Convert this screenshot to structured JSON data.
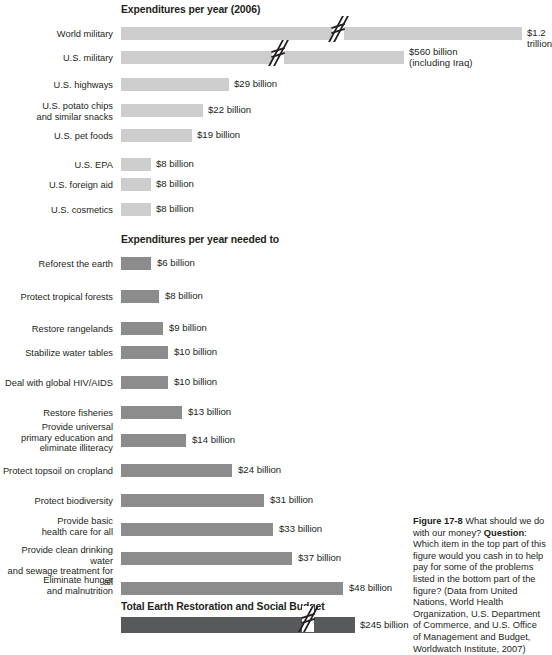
{
  "figure": {
    "number": "Figure 17-8",
    "caption_lead": "Figure 17-8",
    "caption_body": " What should we do with our money? ",
    "question_label": "Question",
    "caption_rest": ": Which item in the top part of this figure would you cash in to help pay for some of the problems listed in the bottom part of the figure? (Data from United Nations, World Health Organization, U.S. Department of Commerce, and U.S. Office of Management and Budget, Worldwatch Institute, 2007)"
  },
  "sections": {
    "top": {
      "title": "Expenditures per year (2006)"
    },
    "middle": {
      "title": "Expenditures per year needed to"
    },
    "total": {
      "title": "Total Earth Restoration and Social Budget"
    }
  },
  "chart_data": {
    "type": "bar",
    "title": "What should we do with our money?",
    "orientation": "horizontal",
    "xlabel": "",
    "ylabel": "",
    "note": "Horizontal bar chart, values in U.S. dollars per year. Top group bars are drawn to a broken (truncated) axis.",
    "groups": [
      {
        "name": "Expenditures per year (2006)",
        "bar_color": "#cdcdcd",
        "categories": [
          "World military",
          "U.S. military",
          "U.S. highways",
          "U.S. potato chips\nand similar snacks",
          "U.S. pet foods",
          "U.S. EPA",
          "U.S. foreign aid",
          "U.S. cosmetics"
        ],
        "values": [
          1200,
          560,
          29,
          22,
          19,
          8,
          8,
          8
        ],
        "value_labels": [
          "$1.2 trillion",
          "$560 billion\n(including Iraq)",
          "$29 billion",
          "$22 billion",
          "$19 billion",
          "$8 billion",
          "$8 billion",
          "$8 billion"
        ],
        "axis_break": [
          true,
          true,
          false,
          false,
          false,
          false,
          false,
          false
        ]
      },
      {
        "name": "Expenditures per year needed to",
        "bar_color": "#8c8c8c",
        "categories": [
          "Reforest the earth",
          "Protect tropical forests",
          "Restore rangelands",
          "Stabilize water tables",
          "Deal with global HIV/AIDS",
          "Restore fisheries",
          "Provide universal\nprimary education and\neliminate illiteracy",
          "Protect topsoil on cropland",
          "Protect biodiversity",
          "Provide basic\nhealth care for all",
          "Provide clean drinking water\nand sewage treatment for all",
          "Eliminate hunger\nand malnutrition"
        ],
        "values": [
          6,
          8,
          9,
          10,
          10,
          13,
          14,
          24,
          31,
          33,
          37,
          48
        ],
        "value_labels": [
          "$6 billion",
          "$8 billion",
          "$9 billion",
          "$10 billion",
          "$10 billion",
          "$13 billion",
          "$14 billion",
          "$24 billion",
          "$31 billion",
          "$33 billion",
          "$37 billion",
          "$48 billion"
        ],
        "axis_break": [
          false,
          false,
          false,
          false,
          false,
          false,
          false,
          false,
          false,
          false,
          false,
          false
        ]
      },
      {
        "name": "Total Earth Restoration and Social Budget",
        "bar_color": "#58595b",
        "categories": [
          ""
        ],
        "values": [
          245
        ],
        "value_labels": [
          "$245 billion"
        ],
        "axis_break": [
          true
        ]
      }
    ],
    "colors": {
      "expenditures_bar": "#cdcdcd",
      "needed_bar": "#8c8c8c",
      "total_bar": "#58595b",
      "text": "#231f20",
      "background": "#ffffff"
    }
  },
  "rows_top": [
    {
      "label": "World military",
      "value_label": "$1.2 trillion",
      "bar_w": 401,
      "label_top": 29,
      "bar_top": 27,
      "value_top": 27,
      "value_left": 527,
      "brk_left": 331,
      "brk_top": 16
    },
    {
      "label": "U.S. military",
      "value_label": "$560 billion\n(including Iraq)",
      "bar_w": 283,
      "label_top": 53,
      "bar_top": 51,
      "value_top": 46,
      "value_left": 409,
      "brk_left": 271,
      "brk_top": 40
    },
    {
      "label": "U.S. highways",
      "value_label": "$29 billion",
      "bar_w": 108,
      "label_top": 80,
      "bar_top": 78,
      "value_top": 78,
      "value_left": 234,
      "brk_left": 0,
      "brk_top": 0
    },
    {
      "label": "U.S. potato chips\nand similar snacks",
      "value_label": "$22 billion",
      "bar_w": 82,
      "label_top": 101,
      "bar_top": 104,
      "value_top": 104,
      "value_left": 208,
      "brk_left": 0,
      "brk_top": 0
    },
    {
      "label": "U.S. pet foods",
      "value_label": "$19 billion",
      "bar_w": 71,
      "label_top": 131,
      "bar_top": 129,
      "value_top": 129,
      "value_left": 197,
      "brk_left": 0,
      "brk_top": 0
    },
    {
      "label": "U.S. EPA",
      "value_label": "$8 billion",
      "bar_w": 30,
      "label_top": 160,
      "bar_top": 158,
      "value_top": 158,
      "value_left": 156,
      "brk_left": 0,
      "brk_top": 0
    },
    {
      "label": "U.S. foreign aid",
      "value_label": "$8 billion",
      "bar_w": 30,
      "label_top": 180,
      "bar_top": 178,
      "value_top": 178,
      "value_left": 156,
      "brk_left": 0,
      "brk_top": 0
    },
    {
      "label": "U.S. cosmetics",
      "value_label": "$8 billion",
      "bar_w": 30,
      "label_top": 205,
      "bar_top": 203,
      "value_top": 203,
      "value_left": 156,
      "brk_left": 0,
      "brk_top": 0
    }
  ],
  "rows_mid": [
    {
      "label": "Reforest the earth",
      "value_label": "$6 billion",
      "bar_w": 30,
      "label_top": 259,
      "bar_top": 257,
      "value_top": 257,
      "value_left": 157
    },
    {
      "label": "Protect tropical forests",
      "value_label": "$8 billion",
      "bar_w": 38,
      "label_top": 292,
      "bar_top": 290,
      "value_top": 290,
      "value_left": 165
    },
    {
      "label": "Restore rangelands",
      "value_label": "$9 billion",
      "bar_w": 42,
      "label_top": 324,
      "bar_top": 322,
      "value_top": 322,
      "value_left": 169
    },
    {
      "label": "Stabilize water tables",
      "value_label": "$10 billion",
      "bar_w": 47,
      "label_top": 348,
      "bar_top": 346,
      "value_top": 346,
      "value_left": 174
    },
    {
      "label": "Deal with global HIV/AIDS",
      "value_label": "$10 billion",
      "bar_w": 47,
      "label_top": 378,
      "bar_top": 376,
      "value_top": 376,
      "value_left": 174
    },
    {
      "label": "Restore fisheries",
      "value_label": "$13 billion",
      "bar_w": 61,
      "label_top": 408,
      "bar_top": 406,
      "value_top": 406,
      "value_left": 188
    },
    {
      "label": "Provide universal\nprimary education and\neliminate illiteracy",
      "value_label": "$14 billion",
      "bar_w": 65,
      "label_top": 422,
      "bar_top": 434,
      "value_top": 434,
      "value_left": 192
    },
    {
      "label": "Protect topsoil on cropland",
      "value_label": "$24 billion",
      "bar_w": 111,
      "label_top": 466,
      "bar_top": 464,
      "value_top": 464,
      "value_left": 238
    },
    {
      "label": "Protect biodiversity",
      "value_label": "$31 billion",
      "bar_w": 143,
      "label_top": 496,
      "bar_top": 494,
      "value_top": 494,
      "value_left": 270
    },
    {
      "label": "Provide basic\nhealth care for all",
      "value_label": "$33 billion",
      "bar_w": 152,
      "label_top": 516,
      "bar_top": 523,
      "value_top": 523,
      "value_left": 279
    },
    {
      "label": "Provide clean drinking water\nand sewage treatment for all",
      "value_label": "$37 billion",
      "bar_w": 171,
      "label_top": 545,
      "bar_top": 552,
      "value_top": 552,
      "value_left": 298
    },
    {
      "label": "Eliminate hunger\nand malnutrition",
      "value_label": "$48 billion",
      "bar_w": 222,
      "label_top": 575,
      "bar_top": 582,
      "value_top": 582,
      "value_left": 349
    }
  ],
  "row_total": {
    "label": "",
    "value_label": "$245 billion",
    "bar_w": 234,
    "bar_top": 617,
    "value_top": 619,
    "value_left": 360,
    "brk_left": 301,
    "brk_top": 606
  }
}
